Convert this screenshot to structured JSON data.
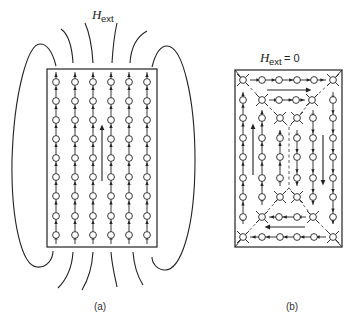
{
  "figure": {
    "panel_a": {
      "caption": "(a)",
      "field_label": {
        "symbol": "H",
        "subscript": "ext"
      },
      "lattice": {
        "columns": 6,
        "rows": 9
      },
      "magnetization_direction": "up",
      "description": "Single-domain sample with external field lines looping around it"
    },
    "panel_b": {
      "caption": "(b)",
      "field_label": {
        "symbol": "H",
        "subscript": "ext",
        "relation": "= 0"
      },
      "domains": [
        {
          "name": "top-closure-domain",
          "direction": "right"
        },
        {
          "name": "left-domain",
          "direction": "up"
        },
        {
          "name": "right-domain",
          "direction": "down"
        },
        {
          "name": "bottom-closure-domain",
          "direction": "left"
        }
      ],
      "description": "Closure-domain structure with no external field"
    }
  }
}
